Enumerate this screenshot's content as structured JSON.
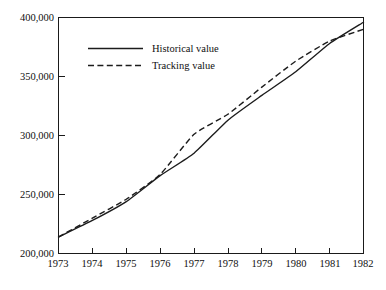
{
  "chart_data": {
    "type": "line",
    "title": "",
    "subtitle": "",
    "xlabel": "",
    "ylabel": "",
    "xlim": [
      1973,
      1982
    ],
    "ylim": [
      200000,
      400000
    ],
    "grid": false,
    "legend_position": "upper-left-inside",
    "x_tick_labels": [
      "1973",
      "1974",
      "1975",
      "1976",
      "1977",
      "1978",
      "1979",
      "1980",
      "1981",
      "1982"
    ],
    "x": [
      1973,
      1974,
      1975,
      1976,
      1977,
      1978,
      1979,
      1980,
      1981,
      1982
    ],
    "y_tick_labels": [
      "200,000",
      "250,000",
      "300,000",
      "350,000",
      "400,000"
    ],
    "y_ticks": [
      200000,
      250000,
      300000,
      350000,
      400000
    ],
    "series": [
      {
        "name": "Historical value",
        "style": "solid",
        "color": "#1c1c1c",
        "values": [
          214000,
          228000,
          244000,
          266000,
          285000,
          313000,
          334000,
          354000,
          378000,
          396000
        ]
      },
      {
        "name": "Tracking value",
        "style": "dashed",
        "color": "#1c1c1c",
        "values": [
          214000,
          230000,
          246000,
          267000,
          301000,
          318000,
          341000,
          363000,
          380000,
          390000
        ]
      }
    ],
    "legend": [
      {
        "label": "Historical value",
        "style": "solid"
      },
      {
        "label": "Tracking value",
        "style": "dashed"
      }
    ]
  },
  "colors": {
    "background": "#ffffff",
    "axis": "#1a1a1a",
    "text": "#101010",
    "series": "#1c1c1c"
  }
}
